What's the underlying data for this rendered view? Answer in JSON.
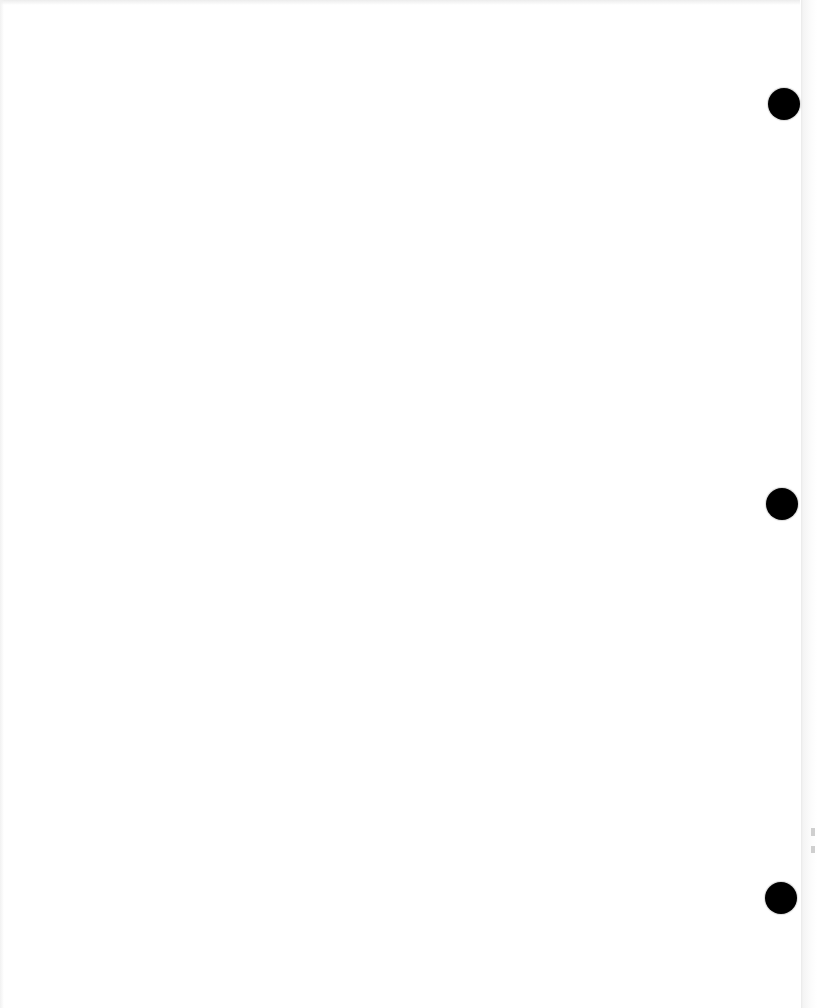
{
  "document": {
    "type": "blank loose-leaf page",
    "background_color": "#ffffff",
    "hole_color": "#000000",
    "holes": [
      {
        "cx": 784,
        "cy": 104,
        "diameter": 32
      },
      {
        "cx": 782,
        "cy": 504,
        "diameter": 32
      },
      {
        "cx": 781,
        "cy": 898,
        "diameter": 32
      }
    ]
  }
}
